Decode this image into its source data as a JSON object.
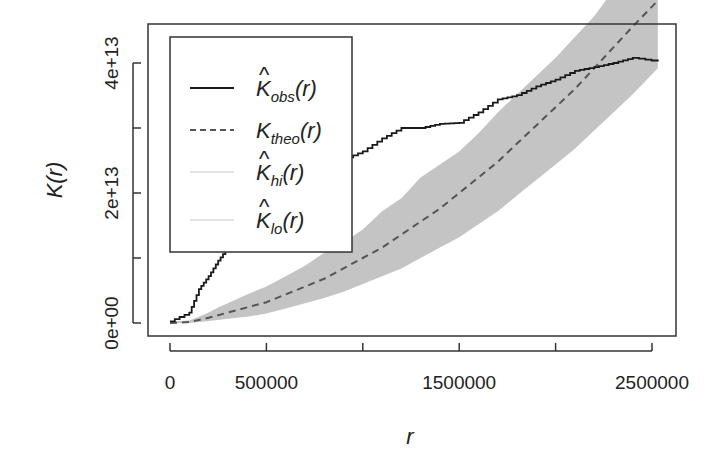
{
  "chart_data": {
    "type": "line",
    "title": "",
    "xlabel": "r",
    "ylabel": "K(r)",
    "xlim": [
      -60000,
      2700000
    ],
    "ylim": [
      -2000000000000,
      46000000000000
    ],
    "x_ticks": [
      0,
      500000,
      1000000,
      1500000,
      2000000,
      2500000
    ],
    "x_tick_labels": [
      "0",
      "500000",
      "",
      "1500000",
      "",
      "2500000"
    ],
    "y_ticks": [
      0,
      10000000000000,
      20000000000000,
      30000000000000,
      40000000000000
    ],
    "y_tick_labels": [
      "0e+00",
      "",
      "2e+13",
      "",
      "4e+13"
    ],
    "grid": false,
    "legend_position": "top-left",
    "legend": [
      {
        "key": "obs",
        "label_main": "K",
        "label_sub": "obs",
        "label_tail": "(r)",
        "hat": true,
        "style": "solid",
        "color": "#1a1a1a"
      },
      {
        "key": "theo",
        "label_main": "K",
        "label_sub": "theo",
        "label_tail": "(r)",
        "hat": false,
        "style": "dashed",
        "color": "#555555"
      },
      {
        "key": "hi",
        "label_main": "K",
        "label_sub": "hi",
        "label_tail": "(r)",
        "hat": true,
        "style": "solid",
        "color": "#c8c8c8"
      },
      {
        "key": "lo",
        "label_main": "K",
        "label_sub": "lo",
        "label_tail": "(r)",
        "hat": true,
        "style": "solid",
        "color": "#c8c8c8"
      }
    ],
    "x": [
      0,
      100000,
      150000,
      200000,
      250000,
      300000,
      400000,
      500000,
      600000,
      700000,
      800000,
      900000,
      1000000,
      1100000,
      1200000,
      1300000,
      1400000,
      1500000,
      1600000,
      1700000,
      1800000,
      1900000,
      2000000,
      2100000,
      2200000,
      2300000,
      2400000,
      2530000
    ],
    "series": [
      {
        "name": "K_obs(r)",
        "values": [
          300000000000.0,
          2000000000000.0,
          6500000000000.0,
          9000000000000.0,
          12000000000000.0,
          14500000000000.0,
          19500000000000.0,
          22000000000000.0,
          25000000000000.0,
          27000000000000.0,
          30500000000000.0,
          31500000000000.0,
          33000000000000.0,
          35500000000000.0,
          37500000000000.0,
          37500000000000.0,
          38300000000000.0,
          38500000000000.0,
          40500000000000.0,
          43000000000000.0,
          43800000000000.0,
          45500000000000.0,
          46800000000000.0,
          48500000000000.0,
          49200000000000.0,
          50000000000000.0,
          51000000000000.0,
          50300000000000.0
        ]
      },
      {
        "name": "K_theo(r)",
        "values": [
          0.0,
          200000000000.0,
          600000000000.0,
          1000000000000.0,
          1500000000000.0,
          2000000000000.0,
          3000000000000.0,
          4000000000000.0,
          5500000000000.0,
          7000000000000.0,
          8500000000000.0,
          10500000000000.0,
          12500000000000.0,
          14500000000000.0,
          17000000000000.0,
          19500000000000.0,
          22000000000000.0,
          25000000000000.0,
          28000000000000.0,
          31000000000000.0,
          34500000000000.0,
          38000000000000.0,
          41500000000000.0,
          45000000000000.0,
          49000000000000.0,
          53000000000000.0,
          57000000000000.0,
          62000000000000.0
        ]
      },
      {
        "name": "K_hi(r)",
        "values": [
          300000000000.0,
          500000000000.0,
          1200000000000.0,
          2000000000000.0,
          3000000000000.0,
          3800000000000.0,
          5500000000000.0,
          7000000000000.0,
          9000000000000.0,
          11000000000000.0,
          13500000000000.0,
          15500000000000.0,
          18000000000000.0,
          21500000000000.0,
          24000000000000.0,
          28000000000000.0,
          30500000000000.0,
          33000000000000.0,
          36500000000000.0,
          40500000000000.0,
          44000000000000.0,
          47500000000000.0,
          51000000000000.0,
          55000000000000.0,
          59000000000000.0,
          64000000000000.0,
          69000000000000.0,
          75000000000000.0
        ]
      },
      {
        "name": "K_lo(r)",
        "values": [
          0.0,
          0.0,
          200000000000.0,
          400000000000.0,
          600000000000.0,
          800000000000.0,
          1200000000000.0,
          1800000000000.0,
          2800000000000.0,
          3800000000000.0,
          4800000000000.0,
          6000000000000.0,
          7500000000000.0,
          9000000000000.0,
          10500000000000.0,
          12500000000000.0,
          14500000000000.0,
          16500000000000.0,
          19000000000000.0,
          21500000000000.0,
          24500000000000.0,
          27500000000000.0,
          30500000000000.0,
          33500000000000.0,
          37000000000000.0,
          40500000000000.0,
          44000000000000.0,
          49000000000000.0
        ]
      }
    ],
    "series_pixel_scale_note": "values scaled to K in units consistent with axis (0e+00 .. 4e+13)",
    "colors": {
      "envelope_fill": "#c4c4c4",
      "axis": "#333333",
      "obs": "#1a1a1a",
      "theo": "#555555"
    }
  }
}
